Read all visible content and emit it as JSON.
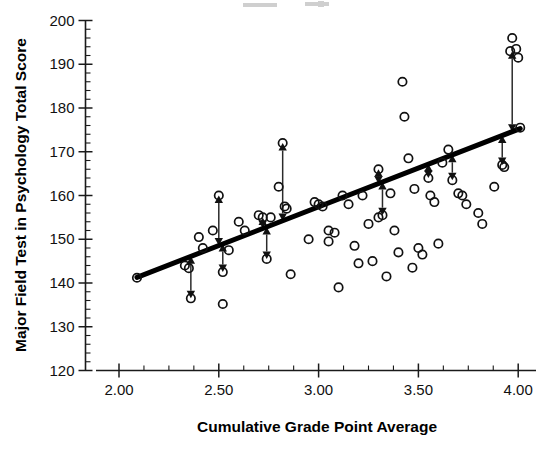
{
  "chart_data": {
    "type": "scatter",
    "title": "",
    "subtitle": "",
    "xlabel": "Cumulative Grade Point Average",
    "ylabel": "Major Field Test in Psychology Total Score",
    "xlim": [
      1.91,
      4.09
    ],
    "ylim": [
      120,
      200
    ],
    "x_ticks": [
      2.0,
      2.5,
      3.0,
      3.5,
      4.0
    ],
    "x_tick_labels": [
      "2.00",
      "2.50",
      "3.00",
      "3.50",
      "4.00"
    ],
    "x_minor_step": 0.125,
    "y_ticks": [
      120,
      130,
      140,
      150,
      160,
      170,
      180,
      190,
      200
    ],
    "y_tick_labels": [
      "120",
      "130",
      "140",
      "150",
      "160",
      "170",
      "180",
      "190",
      "200"
    ],
    "y_minor_step": 2,
    "grid": false,
    "legend": null,
    "marker": "open-circle",
    "series": [
      {
        "name": "Students",
        "points": [
          [
            2.09,
            141.2
          ],
          [
            2.33,
            144.0
          ],
          [
            2.35,
            143.4
          ],
          [
            2.36,
            136.5
          ],
          [
            2.4,
            150.5
          ],
          [
            2.42,
            148.0
          ],
          [
            2.47,
            152.0
          ],
          [
            2.5,
            160.0
          ],
          [
            2.52,
            142.5
          ],
          [
            2.52,
            135.2
          ],
          [
            2.55,
            147.5
          ],
          [
            2.6,
            154.0
          ],
          [
            2.63,
            152.0
          ],
          [
            2.7,
            155.5
          ],
          [
            2.72,
            155.0
          ],
          [
            2.74,
            145.5
          ],
          [
            2.76,
            155.0
          ],
          [
            2.8,
            162.0
          ],
          [
            2.82,
            172.0
          ],
          [
            2.83,
            157.5
          ],
          [
            2.84,
            157.0
          ],
          [
            2.86,
            142.0
          ],
          [
            2.95,
            150.0
          ],
          [
            2.98,
            158.5
          ],
          [
            3.0,
            158.0
          ],
          [
            3.02,
            157.5
          ],
          [
            3.05,
            152.0
          ],
          [
            3.05,
            149.5
          ],
          [
            3.08,
            151.5
          ],
          [
            3.1,
            139.0
          ],
          [
            3.12,
            160.0
          ],
          [
            3.15,
            158.0
          ],
          [
            3.18,
            148.5
          ],
          [
            3.2,
            144.5
          ],
          [
            3.22,
            160.0
          ],
          [
            3.25,
            153.5
          ],
          [
            3.27,
            145.0
          ],
          [
            3.3,
            166.0
          ],
          [
            3.3,
            155.0
          ],
          [
            3.32,
            155.5
          ],
          [
            3.34,
            141.5
          ],
          [
            3.36,
            160.5
          ],
          [
            3.38,
            152.0
          ],
          [
            3.4,
            147.0
          ],
          [
            3.42,
            186.0
          ],
          [
            3.43,
            178.0
          ],
          [
            3.45,
            168.5
          ],
          [
            3.47,
            143.5
          ],
          [
            3.48,
            161.5
          ],
          [
            3.5,
            148.0
          ],
          [
            3.52,
            146.5
          ],
          [
            3.55,
            164.0
          ],
          [
            3.56,
            160.0
          ],
          [
            3.58,
            158.5
          ],
          [
            3.6,
            149.0
          ],
          [
            3.62,
            167.5
          ],
          [
            3.65,
            170.5
          ],
          [
            3.67,
            163.5
          ],
          [
            3.7,
            160.5
          ],
          [
            3.72,
            160.0
          ],
          [
            3.74,
            158.0
          ],
          [
            3.8,
            156.0
          ],
          [
            3.82,
            153.5
          ],
          [
            3.88,
            162.0
          ],
          [
            3.92,
            167.0
          ],
          [
            3.93,
            166.5
          ],
          [
            3.96,
            193.0
          ],
          [
            3.97,
            196.0
          ],
          [
            3.99,
            193.5
          ],
          [
            4.0,
            191.5
          ],
          [
            4.01,
            175.5
          ]
        ]
      }
    ],
    "fit_line": {
      "name": "Least-squares regression line",
      "x_start": 2.09,
      "y_start": 141.3,
      "x_end": 4.01,
      "y_end": 175.3,
      "slope": 17.7,
      "intercept": 104.3
    },
    "residual_arrows": [
      {
        "x": 2.36,
        "y_point": 136.5,
        "y_line": 146.1
      },
      {
        "x": 2.5,
        "y_point": 160.0,
        "y_line": 148.6
      },
      {
        "x": 2.52,
        "y_point": 142.5,
        "y_line": 148.9
      },
      {
        "x": 2.72,
        "y_point": 155.0,
        "y_line": 152.5
      },
      {
        "x": 2.74,
        "y_point": 145.5,
        "y_line": 152.8
      },
      {
        "x": 2.82,
        "y_point": 172.0,
        "y_line": 154.2
      },
      {
        "x": 3.3,
        "y_point": 166.0,
        "y_line": 162.7
      },
      {
        "x": 3.32,
        "y_point": 155.5,
        "y_line": 163.1
      },
      {
        "x": 3.55,
        "y_point": 164.0,
        "y_line": 167.2
      },
      {
        "x": 3.67,
        "y_point": 163.5,
        "y_line": 169.3
      },
      {
        "x": 3.92,
        "y_point": 167.0,
        "y_line": 173.7
      },
      {
        "x": 3.97,
        "y_point": 193.0,
        "y_line": 174.6
      }
    ],
    "annotations": [
      "Double-headed vertical arrows mark residuals between observed scores and the regression line"
    ]
  },
  "axis": {
    "x_title": "Cumulative Grade Point Average",
    "y_title": "Major Field Test in Psychology Total Score"
  }
}
